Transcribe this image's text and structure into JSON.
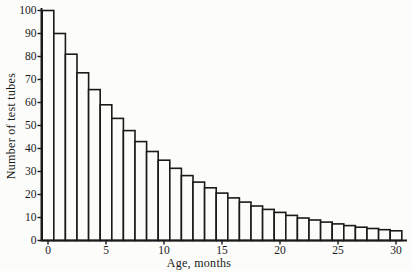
{
  "figure": {
    "background": "#fcfcfa",
    "line_color": "#1a1a1a",
    "bar_fill": "#fcfcfa"
  },
  "chart_data": {
    "type": "bar",
    "title": "",
    "xlabel": "Age, months",
    "ylabel": "Number of test tubes",
    "months": [
      0,
      1,
      2,
      3,
      4,
      5,
      6,
      7,
      8,
      9,
      10,
      11,
      12,
      13,
      14,
      15,
      16,
      17,
      18,
      19,
      20,
      21,
      22,
      23,
      24,
      25,
      26,
      27,
      28,
      29,
      30
    ],
    "values": [
      100,
      90,
      81,
      72.9,
      65.6,
      59,
      53.1,
      47.8,
      43,
      38.7,
      34.9,
      31.4,
      28.2,
      25.4,
      22.9,
      20.6,
      18.5,
      16.7,
      15,
      13.5,
      12.2,
      10.9,
      9.8,
      8.9,
      8,
      7.2,
      6.5,
      5.8,
      5.2,
      4.7,
      4.2
    ],
    "bar_width": 1,
    "x_ticks": [
      0,
      5,
      10,
      15,
      20,
      25,
      30
    ],
    "y_ticks": [
      0,
      10,
      20,
      30,
      40,
      50,
      60,
      70,
      80,
      90,
      100
    ],
    "xlim": [
      -0.5,
      31
    ],
    "ylim": [
      0,
      100
    ],
    "grid": false,
    "legend": null
  }
}
